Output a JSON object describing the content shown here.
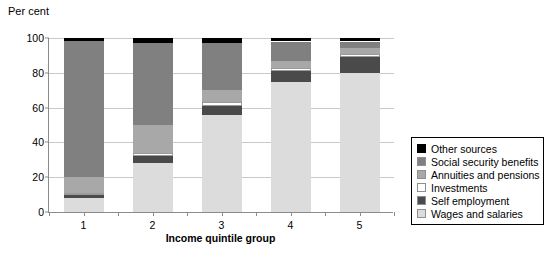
{
  "chart": {
    "type": "bar",
    "title": "",
    "ylabel": "Per cent",
    "xlabel": "Income quintile group"
  },
  "chart_data": {
    "type": "bar",
    "subtype": "stacked-100-percent",
    "title": "",
    "subtitle": "",
    "xlabel": "Income quintile group",
    "ylabel": "Per cent",
    "ylim": [
      0,
      100
    ],
    "yticks": [
      0,
      20,
      40,
      60,
      80,
      100
    ],
    "ytick_labels": [
      "0",
      "20",
      "40",
      "60",
      "80",
      "100"
    ],
    "grid": true,
    "grid_axis": "y",
    "legend_position": "right",
    "categories": [
      "1",
      "2",
      "3",
      "4",
      "5"
    ],
    "x": [
      1,
      2,
      3,
      4,
      5
    ],
    "stack_order_bottom_to_top": [
      "Wages and salaries",
      "Self employment",
      "Investments",
      "Annuities and pensions",
      "Social security benefits",
      "Other sources"
    ],
    "series": [
      {
        "name": "Wages and salaries",
        "color": "#dcdcdc",
        "values": [
          8,
          28,
          56,
          75,
          80
        ]
      },
      {
        "name": "Self employment",
        "color": "#4a4a4a",
        "values": [
          2,
          4,
          5,
          6,
          9
        ]
      },
      {
        "name": "Investments",
        "color": "#ffffff",
        "values": [
          1,
          2,
          2,
          2,
          2
        ]
      },
      {
        "name": "Annuities and pensions",
        "color": "#a8a8a8",
        "values": [
          9,
          16,
          7,
          4,
          3
        ]
      },
      {
        "name": "Social security benefits",
        "color": "#808080",
        "values": [
          78,
          47,
          27,
          11,
          4
        ]
      },
      {
        "name": "Other sources",
        "color": "#000000",
        "values": [
          2,
          3,
          3,
          2,
          2
        ]
      }
    ],
    "cumulative_tops": {
      "1": [
        8,
        10,
        11,
        20,
        98,
        100
      ],
      "2": [
        28,
        32,
        34,
        50,
        97,
        100
      ],
      "3": [
        56,
        61,
        63,
        70,
        97,
        100
      ],
      "4": [
        75,
        81,
        83,
        87,
        98,
        100
      ],
      "5": [
        80,
        89,
        91,
        94,
        98,
        100
      ]
    }
  },
  "legend": {
    "items": [
      {
        "label": "Other sources",
        "color": "#000000"
      },
      {
        "label": "Social security benefits",
        "color": "#808080"
      },
      {
        "label": "Annuities and pensions",
        "color": "#a8a8a8"
      },
      {
        "label": "Investments",
        "color": "#ffffff"
      },
      {
        "label": "Self employment",
        "color": "#4a4a4a"
      },
      {
        "label": "Wages and salaries",
        "color": "#dcdcdc"
      }
    ]
  }
}
